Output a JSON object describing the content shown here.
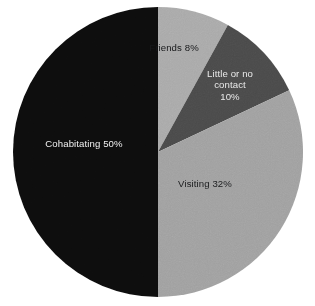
{
  "chart_data": {
    "type": "pie",
    "title": "",
    "subtitle": "",
    "xlabel": "",
    "ylabel": "",
    "legend_position": "none",
    "grid": false,
    "labels_inside_slices": true,
    "start_angle_deg": 0,
    "direction": "clockwise",
    "categories": [
      "Friends",
      "Little or no contact",
      "Visiting",
      "Cohabitating"
    ],
    "values": [
      8,
      10,
      32,
      50
    ],
    "value_unit": "%",
    "slices": [
      {
        "name": "Friends",
        "value": 8,
        "label": "Friends 8%",
        "color": "#a9a9a9",
        "text_color": "#17181a",
        "start_deg": 0,
        "end_deg": 28.8
      },
      {
        "name": "Little or no contact",
        "value": 10,
        "label": "Little or no\ncontact\n10%",
        "color": "#4a4a4a",
        "text_color": "#e9e9e9",
        "start_deg": 28.8,
        "end_deg": 64.8
      },
      {
        "name": "Visiting",
        "value": 32,
        "label": "Visiting 32%",
        "color": "#a0a0a0",
        "text_color": "#1b1c1e",
        "start_deg": 64.8,
        "end_deg": 180
      },
      {
        "name": "Cohabitating",
        "value": 50,
        "label": "Cohabitating 50%",
        "color": "#0d0d0d",
        "text_color": "#f0f0f0",
        "start_deg": 180,
        "end_deg": 360
      }
    ],
    "geometry": {
      "center_x": 158,
      "center_y": 152,
      "radius": 145
    },
    "background_color": "#ffffff"
  }
}
